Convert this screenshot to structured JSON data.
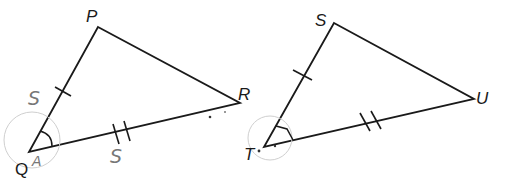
{
  "diagram": {
    "triangles": [
      {
        "name": "PQR",
        "vertices": {
          "P": {
            "label": "P",
            "x": 98,
            "y": 27
          },
          "Q": {
            "label": "Q",
            "x": 29,
            "y": 152
          },
          "R": {
            "label": "R",
            "x": 240,
            "y": 103
          }
        },
        "markings": {
          "PQ": "single tick",
          "QR": "double tick",
          "angle_Q": "arc"
        },
        "handwritten": {
          "side_PQ": "S",
          "side_QR": "S",
          "angle_Q": "A"
        }
      },
      {
        "name": "STU",
        "vertices": {
          "S": {
            "label": "S",
            "x": 334,
            "y": 23
          },
          "T": {
            "label": "T",
            "x": 264,
            "y": 147
          },
          "U": {
            "label": "U",
            "x": 474,
            "y": 99
          }
        },
        "markings": {
          "ST": "single tick",
          "TU": "double tick",
          "angle_T": "arc"
        }
      }
    ],
    "labels": {
      "P": "P",
      "Q": "Q",
      "R": "R",
      "S": "S",
      "T": "T",
      "U": "U",
      "hand_s1": "S",
      "hand_s2": "S",
      "hand_a": "A"
    }
  }
}
